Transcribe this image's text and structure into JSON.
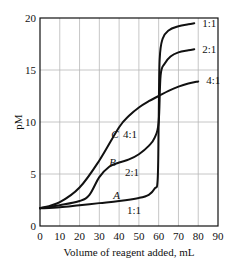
{
  "chart_data": {
    "type": "line",
    "title": "",
    "xlabel": "Volume of reagent added, mL",
    "ylabel": "pM",
    "xlim": [
      0,
      90
    ],
    "ylim": [
      0,
      20
    ],
    "xticks": [
      0,
      10,
      20,
      30,
      40,
      50,
      60,
      70,
      80,
      90
    ],
    "yticks": [
      0,
      5,
      10,
      15,
      20
    ],
    "grid": true,
    "legend_position": "inline labels",
    "series": [
      {
        "name": "A (1:1)",
        "curve_label": "A",
        "ratio_label_low": "1:1",
        "ratio_label_high": "1:1",
        "x": [
          0,
          10,
          20,
          30,
          40,
          50,
          55,
          58,
          59.5,
          60,
          60.5,
          62,
          65,
          70,
          75,
          78
        ],
        "y": [
          1.7,
          1.8,
          2.0,
          2.2,
          2.4,
          2.7,
          3.0,
          3.6,
          4.5,
          10.0,
          16.0,
          18.0,
          18.8,
          19.2,
          19.4,
          19.5
        ]
      },
      {
        "name": "B (2:1)",
        "curve_label": "B",
        "ratio_label_low": "2:1",
        "ratio_label_high": "2:1",
        "x": [
          0,
          10,
          20,
          25,
          30,
          35,
          40,
          45,
          50,
          55,
          58,
          60,
          61,
          63,
          66,
          70,
          75,
          78
        ],
        "y": [
          1.7,
          2.0,
          2.4,
          3.0,
          4.7,
          5.7,
          6.1,
          6.4,
          6.9,
          7.7,
          8.5,
          10.0,
          14.5,
          15.6,
          16.3,
          16.7,
          16.9,
          17.0
        ]
      },
      {
        "name": "C (4:1)",
        "curve_label": "C",
        "ratio_label_low": "4:1",
        "ratio_label_high": "4:1",
        "x": [
          0,
          10,
          20,
          30,
          40,
          45,
          50,
          55,
          60,
          65,
          70,
          75,
          80
        ],
        "y": [
          1.7,
          2.3,
          3.7,
          6.3,
          9.5,
          10.6,
          11.4,
          12.0,
          12.5,
          13.0,
          13.4,
          13.7,
          13.9
        ]
      }
    ],
    "annotations": [
      {
        "text": "C",
        "x": 36,
        "y": 8.8,
        "italic": true
      },
      {
        "text": "4:1",
        "x": 42,
        "y": 8.8
      },
      {
        "text": "B",
        "x": 35,
        "y": 6.2,
        "italic": true
      },
      {
        "text": "2:1",
        "x": 43,
        "y": 5.2
      },
      {
        "text": "A",
        "x": 37,
        "y": 3.0,
        "italic": true
      },
      {
        "text": "1:1",
        "x": 44,
        "y": 1.5
      },
      {
        "text": "1:1",
        "x": 82,
        "y": 19.5
      },
      {
        "text": "2:1",
        "x": 82,
        "y": 17.0
      },
      {
        "text": "4:1",
        "x": 84,
        "y": 14.0
      }
    ]
  }
}
